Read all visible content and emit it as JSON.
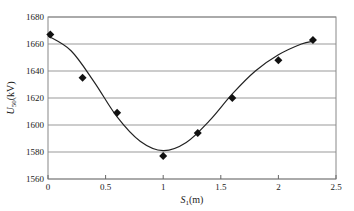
{
  "chart_data": {
    "type": "scatter",
    "title": "",
    "xlabel": "S1(m)",
    "xlabel_main": "S",
    "xlabel_sub": "1",
    "xlabel_unit": "(m)",
    "ylabel": "U50(kV)",
    "ylabel_main": "U",
    "ylabel_sub": "50",
    "ylabel_unit": "(kV)",
    "xlim": [
      0,
      2.5
    ],
    "ylim": [
      1560,
      1680
    ],
    "xticks": [
      "0",
      "0.5",
      "1",
      "1.5",
      "2",
      "2.5"
    ],
    "yticks": [
      "1560",
      "1580",
      "1600",
      "1620",
      "1640",
      "1660",
      "1680"
    ],
    "grid": "horizontal",
    "legend": "none",
    "series": [
      {
        "name": "measured",
        "marker": "diamond",
        "x": [
          0.02,
          0.3,
          0.6,
          1.0,
          1.3,
          1.6,
          2.0,
          2.3
        ],
        "y": [
          1667,
          1635,
          1609,
          1577,
          1594,
          1620,
          1648,
          1663
        ]
      },
      {
        "name": "fitted curve",
        "style": "line",
        "x": [
          0.0,
          0.2,
          0.4,
          0.6,
          0.8,
          1.0,
          1.2,
          1.4,
          1.6,
          1.8,
          2.0,
          2.2,
          2.3
        ],
        "y": [
          1666,
          1655,
          1632,
          1606,
          1588,
          1581,
          1587,
          1603,
          1623,
          1640,
          1652,
          1660,
          1662
        ]
      }
    ]
  }
}
